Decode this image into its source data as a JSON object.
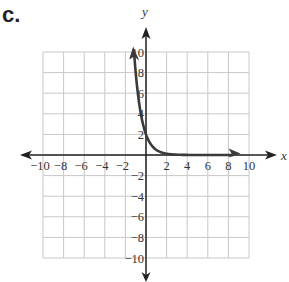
{
  "part_label": "c.",
  "chart_data": {
    "type": "line",
    "title": "",
    "xlabel": "x",
    "ylabel": "y",
    "xlim": [
      -10,
      10
    ],
    "ylim": [
      -10,
      10
    ],
    "grid": true,
    "grid_step": 2,
    "x_ticks": [
      "-10",
      "-8",
      "-6",
      "-4",
      "-2",
      "2",
      "4",
      "6",
      "8",
      "10"
    ],
    "y_ticks": [
      "10",
      "8",
      "6",
      "4",
      "2",
      "-2",
      "-4",
      "-6",
      "-8",
      "-10"
    ],
    "series": [
      {
        "name": "exponential decay curve",
        "x": [
          -1.15,
          -1,
          -0.5,
          0,
          0.5,
          1,
          2,
          4,
          8.5
        ],
        "y": [
          9.8,
          8,
          4,
          2,
          1,
          0.5,
          0.125,
          0.01,
          0
        ],
        "arrows": "both"
      }
    ],
    "colors": {
      "curve": "#3a3a3a",
      "axes": "#222222",
      "grid": "#c8c8c8"
    }
  }
}
